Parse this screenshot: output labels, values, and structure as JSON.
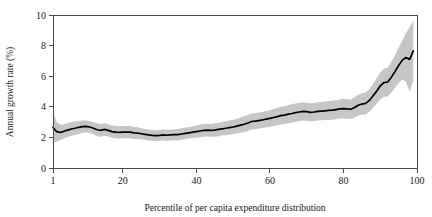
{
  "chart_data": {
    "type": "line",
    "title": "",
    "subtitle": "",
    "xlabel": "Percentile of per capita expenditure distribution",
    "ylabel": "Annual growth rate (%)",
    "xlim": [
      1,
      100
    ],
    "ylim": [
      0,
      10
    ],
    "xticks": [
      1,
      20,
      40,
      60,
      80,
      100
    ],
    "xtick_labels": [
      "1",
      "20",
      "40",
      "60",
      "80",
      "100"
    ],
    "yticks": [
      0,
      2,
      4,
      6,
      8,
      10
    ],
    "ytick_labels": [
      "0",
      "2",
      "4",
      "6",
      "8",
      "10"
    ],
    "grid": false,
    "legend": null,
    "legend_position": "none",
    "annotations": [],
    "colors": {
      "line": "#000000",
      "band": "#c3c3c3",
      "axis": "#4a4a4a",
      "background": "#ffffff",
      "text": "#161616"
    },
    "series": [
      {
        "name": "Annual growth rate",
        "style": "line",
        "x": [
          1,
          2,
          3,
          4,
          5,
          6,
          7,
          8,
          9,
          10,
          11,
          12,
          13,
          14,
          15,
          16,
          17,
          18,
          19,
          20,
          21,
          22,
          23,
          24,
          25,
          26,
          27,
          28,
          29,
          30,
          31,
          32,
          33,
          34,
          35,
          36,
          37,
          38,
          39,
          40,
          41,
          42,
          43,
          44,
          45,
          46,
          47,
          48,
          49,
          50,
          51,
          52,
          53,
          54,
          55,
          56,
          57,
          58,
          59,
          60,
          61,
          62,
          63,
          64,
          65,
          66,
          67,
          68,
          69,
          70,
          71,
          72,
          73,
          74,
          75,
          76,
          77,
          78,
          79,
          80,
          81,
          82,
          83,
          84,
          85,
          86,
          87,
          88,
          89,
          90,
          91,
          92,
          93,
          94,
          95,
          96,
          97,
          98,
          99
        ],
        "values": [
          2.65,
          2.38,
          2.32,
          2.4,
          2.48,
          2.55,
          2.6,
          2.66,
          2.7,
          2.72,
          2.68,
          2.6,
          2.5,
          2.46,
          2.52,
          2.46,
          2.38,
          2.34,
          2.33,
          2.34,
          2.35,
          2.34,
          2.3,
          2.28,
          2.24,
          2.2,
          2.16,
          2.13,
          2.12,
          2.13,
          2.16,
          2.14,
          2.16,
          2.18,
          2.18,
          2.22,
          2.26,
          2.3,
          2.34,
          2.38,
          2.42,
          2.46,
          2.48,
          2.46,
          2.48,
          2.52,
          2.56,
          2.6,
          2.64,
          2.68,
          2.74,
          2.8,
          2.86,
          2.94,
          3.04,
          3.06,
          3.1,
          3.14,
          3.2,
          3.24,
          3.3,
          3.36,
          3.42,
          3.46,
          3.52,
          3.56,
          3.62,
          3.66,
          3.7,
          3.68,
          3.64,
          3.66,
          3.7,
          3.72,
          3.74,
          3.76,
          3.78,
          3.82,
          3.86,
          3.88,
          3.86,
          3.84,
          3.96,
          4.1,
          4.18,
          4.22,
          4.4,
          4.7,
          5.02,
          5.36,
          5.58,
          5.62,
          5.92,
          6.3,
          6.7,
          7.05,
          7.22,
          7.1,
          7.65
        ]
      },
      {
        "name": "Confidence band upper",
        "style": "band-upper",
        "values": [
          3.7,
          3.0,
          2.82,
          2.86,
          2.94,
          3.0,
          3.04,
          3.08,
          3.1,
          3.1,
          3.06,
          3.0,
          2.92,
          2.88,
          2.92,
          2.86,
          2.78,
          2.74,
          2.73,
          2.74,
          2.75,
          2.74,
          2.7,
          2.66,
          2.6,
          2.56,
          2.52,
          2.48,
          2.47,
          2.48,
          2.52,
          2.5,
          2.52,
          2.54,
          2.56,
          2.6,
          2.64,
          2.68,
          2.72,
          2.78,
          2.84,
          2.88,
          2.9,
          2.88,
          2.92,
          2.96,
          3.0,
          3.06,
          3.1,
          3.16,
          3.22,
          3.3,
          3.38,
          3.46,
          3.56,
          3.58,
          3.62,
          3.66,
          3.74,
          3.78,
          3.86,
          3.92,
          4.0,
          4.04,
          4.12,
          4.16,
          4.22,
          4.26,
          4.3,
          4.28,
          4.24,
          4.26,
          4.3,
          4.32,
          4.34,
          4.38,
          4.4,
          4.44,
          4.48,
          4.52,
          4.5,
          4.48,
          4.62,
          4.78,
          4.88,
          4.94,
          5.14,
          5.48,
          5.86,
          6.24,
          6.5,
          6.56,
          6.92,
          7.36,
          7.86,
          8.32,
          8.8,
          9.2,
          9.62
        ]
      },
      {
        "name": "Confidence band lower",
        "style": "band-lower",
        "values": [
          1.62,
          1.74,
          1.82,
          1.92,
          2.02,
          2.1,
          2.16,
          2.22,
          2.28,
          2.32,
          2.28,
          2.2,
          2.08,
          2.04,
          2.1,
          2.06,
          1.98,
          1.94,
          1.93,
          1.94,
          1.95,
          1.94,
          1.9,
          1.9,
          1.88,
          1.84,
          1.8,
          1.78,
          1.77,
          1.78,
          1.8,
          1.78,
          1.8,
          1.82,
          1.8,
          1.84,
          1.88,
          1.92,
          1.96,
          1.98,
          2.0,
          2.04,
          2.06,
          2.04,
          2.04,
          2.08,
          2.12,
          2.14,
          2.18,
          2.2,
          2.26,
          2.3,
          2.34,
          2.42,
          2.52,
          2.54,
          2.58,
          2.62,
          2.66,
          2.7,
          2.74,
          2.8,
          2.84,
          2.88,
          2.92,
          2.96,
          3.02,
          3.06,
          3.1,
          3.08,
          3.04,
          3.06,
          3.1,
          3.12,
          3.14,
          3.14,
          3.16,
          3.2,
          3.24,
          3.24,
          3.22,
          3.2,
          3.3,
          3.42,
          3.48,
          3.5,
          3.66,
          3.92,
          4.18,
          4.48,
          4.66,
          4.68,
          4.92,
          5.24,
          5.54,
          5.78,
          5.64,
          5.0,
          5.68
        ]
      }
    ]
  }
}
